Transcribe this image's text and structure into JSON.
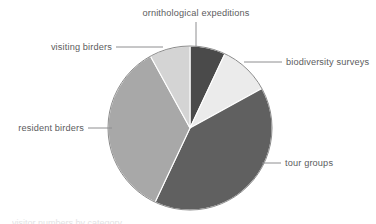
{
  "chart_data": {
    "type": "pie",
    "title": "",
    "subtitle": "",
    "xlabel": "",
    "ylabel": "",
    "grid": false,
    "legend_position": "callout-labels",
    "start_angle_deg": 0,
    "direction": "clockwise",
    "center": {
      "x": 190,
      "y": 128
    },
    "radius": 82,
    "categories": [
      "ornithological expeditions",
      "biodiversity surveys",
      "tour groups",
      "resident birders",
      "visiting birders"
    ],
    "values": [
      7,
      10,
      40,
      35,
      8
    ],
    "unit": "percent",
    "slices": [
      {
        "label": "ornithological expeditions",
        "value": 7,
        "start_deg": 0,
        "end_deg": 25.2,
        "color": "#4a4a4a",
        "label_x": 196,
        "label_y": 16,
        "label_anchor": "middle",
        "leader": "M196,22 L196,47"
      },
      {
        "label": "biodiversity surveys",
        "value": 10,
        "start_deg": 25.2,
        "end_deg": 61.2,
        "color": "#ebebeb",
        "label_x": 286,
        "label_y": 65,
        "label_anchor": "start",
        "leader": "M282,62 L244,62"
      },
      {
        "label": "tour groups",
        "value": 40,
        "start_deg": 61.2,
        "end_deg": 205.2,
        "color": "#606060",
        "label_x": 285,
        "label_y": 166,
        "label_anchor": "start",
        "leader": "M281,163 L262,163"
      },
      {
        "label": "resident birders",
        "value": 35,
        "start_deg": 205.2,
        "end_deg": 331.2,
        "color": "#a8a8a8",
        "label_x": 84,
        "label_y": 131,
        "label_anchor": "end",
        "leader": "M88,128 L112,128"
      },
      {
        "label": "visiting birders",
        "value": 8,
        "start_deg": 331.2,
        "end_deg": 360,
        "color": "#d4d4d4",
        "label_x": 112,
        "label_y": 50,
        "label_anchor": "end",
        "leader": "M116,47 L163,47"
      }
    ],
    "colors": {
      "ornithological_expeditions": "#4a4a4a",
      "biodiversity_surveys": "#ebebeb",
      "tour_groups": "#606060",
      "resident_birders": "#a8a8a8",
      "visiting_birders": "#d4d4d4",
      "background": "#ffffff",
      "label_text": "#5c5c5e",
      "leader_line": "#8e8e90",
      "pie_outline": "#8a8a8a"
    }
  },
  "labels": {
    "ornithological_expeditions": "ornithological expeditions",
    "biodiversity_surveys": "biodiversity surveys",
    "tour_groups": "tour groups",
    "resident_birders": "resident birders",
    "visiting_birders": "visiting birders"
  },
  "footer": {
    "clipped_caption": "visitor numbers by category"
  }
}
